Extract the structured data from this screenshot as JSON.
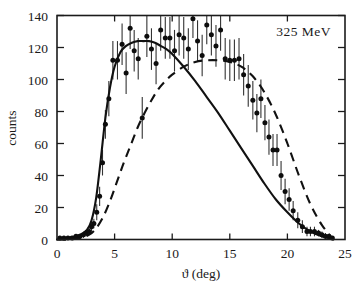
{
  "chart_data": {
    "type": "scatter",
    "title": "",
    "annotation": "325 MeV",
    "xlabel": "ϑ (deg)",
    "ylabel": "counts",
    "xlim": [
      0,
      25
    ],
    "ylim": [
      0,
      140
    ],
    "xticks": [
      0,
      5,
      10,
      15,
      20,
      25
    ],
    "xticklabels": [
      "0",
      "5",
      "10",
      "15",
      "20",
      "25"
    ],
    "yticks": [
      0,
      20,
      40,
      60,
      80,
      100,
      120,
      140
    ],
    "yticklabels": [
      "0",
      "20",
      "40",
      "60",
      "80",
      "100",
      "120",
      "140"
    ],
    "grid": false,
    "legend": null,
    "series": [
      {
        "name": "measured counts",
        "type": "scatter",
        "marker": "filled-circle",
        "errorbars": "vertical",
        "points": [
          {
            "x": 0.25,
            "y": 1,
            "yerr": 1
          },
          {
            "x": 0.6,
            "y": 1,
            "yerr": 1
          },
          {
            "x": 0.95,
            "y": 1,
            "yerr": 1
          },
          {
            "x": 1.3,
            "y": 1,
            "yerr": 1
          },
          {
            "x": 1.65,
            "y": 2,
            "yerr": 1
          },
          {
            "x": 2.0,
            "y": 2,
            "yerr": 1
          },
          {
            "x": 2.3,
            "y": 3,
            "yerr": 2
          },
          {
            "x": 2.55,
            "y": 4,
            "yerr": 2
          },
          {
            "x": 2.8,
            "y": 5,
            "yerr": 2
          },
          {
            "x": 3.0,
            "y": 8,
            "yerr": 3
          },
          {
            "x": 3.2,
            "y": 10,
            "yerr": 3
          },
          {
            "x": 3.45,
            "y": 17,
            "yerr": 5
          },
          {
            "x": 3.7,
            "y": 27,
            "yerr": 6
          },
          {
            "x": 3.95,
            "y": 48,
            "yerr": 8
          },
          {
            "x": 4.2,
            "y": 72,
            "yerr": 9
          },
          {
            "x": 4.5,
            "y": 88,
            "yerr": 11
          },
          {
            "x": 4.85,
            "y": 112,
            "yerr": 12
          },
          {
            "x": 5.25,
            "y": 112,
            "yerr": 12
          },
          {
            "x": 5.65,
            "y": 122,
            "yerr": 13
          },
          {
            "x": 6.0,
            "y": 104,
            "yerr": 13
          },
          {
            "x": 6.35,
            "y": 132,
            "yerr": 13
          },
          {
            "x": 6.7,
            "y": 118,
            "yerr": 13
          },
          {
            "x": 7.05,
            "y": 113,
            "yerr": 13
          },
          {
            "x": 7.4,
            "y": 76,
            "yerr": 13
          },
          {
            "x": 7.8,
            "y": 127,
            "yerr": 13
          },
          {
            "x": 8.2,
            "y": 119,
            "yerr": 13
          },
          {
            "x": 8.6,
            "y": 110,
            "yerr": 13
          },
          {
            "x": 9.0,
            "y": 131,
            "yerr": 13
          },
          {
            "x": 9.4,
            "y": 126,
            "yerr": 13
          },
          {
            "x": 9.8,
            "y": 126,
            "yerr": 13
          },
          {
            "x": 10.2,
            "y": 118,
            "yerr": 13
          },
          {
            "x": 10.6,
            "y": 128,
            "yerr": 13
          },
          {
            "x": 11.0,
            "y": 126,
            "yerr": 13
          },
          {
            "x": 11.4,
            "y": 119,
            "yerr": 13
          },
          {
            "x": 11.8,
            "y": 138,
            "yerr": 12
          },
          {
            "x": 12.2,
            "y": 124,
            "yerr": 13
          },
          {
            "x": 12.6,
            "y": 115,
            "yerr": 13
          },
          {
            "x": 13.0,
            "y": 134,
            "yerr": 12
          },
          {
            "x": 13.4,
            "y": 128,
            "yerr": 13
          },
          {
            "x": 13.8,
            "y": 121,
            "yerr": 13
          },
          {
            "x": 14.2,
            "y": 131,
            "yerr": 13
          },
          {
            "x": 14.6,
            "y": 113,
            "yerr": 13
          },
          {
            "x": 15.0,
            "y": 112,
            "yerr": 13
          },
          {
            "x": 15.4,
            "y": 112,
            "yerr": 13
          },
          {
            "x": 15.8,
            "y": 113,
            "yerr": 13
          },
          {
            "x": 16.2,
            "y": 103,
            "yerr": 13
          },
          {
            "x": 16.6,
            "y": 96,
            "yerr": 13
          },
          {
            "x": 17.0,
            "y": 87,
            "yerr": 12
          },
          {
            "x": 17.35,
            "y": 79,
            "yerr": 12
          },
          {
            "x": 17.7,
            "y": 88,
            "yerr": 12
          },
          {
            "x": 18.05,
            "y": 73,
            "yerr": 11
          },
          {
            "x": 18.4,
            "y": 64,
            "yerr": 11
          },
          {
            "x": 18.75,
            "y": 56,
            "yerr": 10
          },
          {
            "x": 19.1,
            "y": 56,
            "yerr": 10
          },
          {
            "x": 19.45,
            "y": 40,
            "yerr": 9
          },
          {
            "x": 19.8,
            "y": 30,
            "yerr": 8
          },
          {
            "x": 20.15,
            "y": 25,
            "yerr": 7
          },
          {
            "x": 20.5,
            "y": 18,
            "yerr": 6
          },
          {
            "x": 20.9,
            "y": 12,
            "yerr": 5
          },
          {
            "x": 21.3,
            "y": 8,
            "yerr": 4
          },
          {
            "x": 21.7,
            "y": 5,
            "yerr": 3
          },
          {
            "x": 22.0,
            "y": 5,
            "yerr": 3
          },
          {
            "x": 22.35,
            "y": 5,
            "yerr": 3
          },
          {
            "x": 22.7,
            "y": 4,
            "yerr": 2
          },
          {
            "x": 23.0,
            "y": 3,
            "yerr": 2
          },
          {
            "x": 23.3,
            "y": 2,
            "yerr": 2
          },
          {
            "x": 23.6,
            "y": 2,
            "yerr": 1
          },
          {
            "x": 23.9,
            "y": 1,
            "yerr": 1
          }
        ]
      },
      {
        "name": "solid theory curve",
        "type": "line",
        "style": "solid",
        "x": [
          0.0,
          1.0,
          2.0,
          2.6,
          3.0,
          3.4,
          3.8,
          4.2,
          4.6,
          5.0,
          5.5,
          6.0,
          6.5,
          7.0,
          7.5,
          8.0,
          8.5,
          9.0,
          9.5,
          10.0,
          11.0,
          12.0,
          13.0,
          14.0,
          15.0,
          16.0,
          17.0,
          18.0,
          19.0,
          20.0,
          21.0,
          22.0,
          23.0,
          24.0
        ],
        "y": [
          0,
          1,
          3,
          6,
          12,
          26,
          50,
          76,
          95,
          108,
          117,
          121,
          123,
          124,
          124,
          124,
          123,
          121,
          119,
          116,
          108,
          99,
          89,
          79,
          68,
          57,
          46,
          35,
          25,
          17,
          10,
          5,
          2,
          0
        ]
      },
      {
        "name": "dashed theory curve",
        "type": "line",
        "style": "dashed",
        "x": [
          0.0,
          1.0,
          2.0,
          2.8,
          3.4,
          4.0,
          4.6,
          5.2,
          5.8,
          6.4,
          7.0,
          7.6,
          8.2,
          8.8,
          9.4,
          10.0,
          11.0,
          12.0,
          13.0,
          14.0,
          15.0,
          16.0,
          17.0,
          18.0,
          19.0,
          20.0,
          21.0,
          22.0,
          23.0,
          24.0
        ],
        "y": [
          0,
          0,
          1,
          3,
          7,
          14,
          24,
          36,
          48,
          59,
          70,
          79,
          87,
          94,
          99,
          103,
          108,
          111,
          112,
          112,
          111,
          108,
          102,
          92,
          78,
          60,
          40,
          22,
          9,
          0
        ]
      }
    ]
  }
}
